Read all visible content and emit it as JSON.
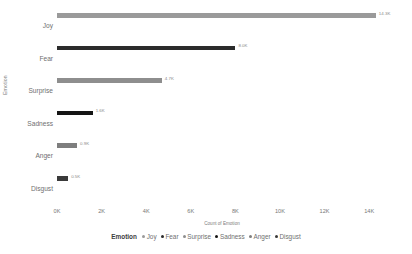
{
  "chart_data": {
    "type": "bar",
    "orientation": "horizontal",
    "title": "",
    "xlabel": "Count of Emotion",
    "ylabel": "Emotion",
    "categories": [
      "Joy",
      "Fear",
      "Surprise",
      "Sadness",
      "Anger",
      "Disgust"
    ],
    "values": [
      14300,
      8000,
      4700,
      1600,
      900,
      500
    ],
    "data_labels": [
      "14.3K",
      "8.0K",
      "4.7K",
      "1.6K",
      "0.9K",
      "0.5K"
    ],
    "colors": [
      "#9a9a9a",
      "#2b2b2b",
      "#8e8e8e",
      "#151515",
      "#7e7e7e",
      "#3a3a3a"
    ],
    "xlim": [
      0,
      14800
    ],
    "xticks": [
      0,
      2000,
      4000,
      6000,
      8000,
      10000,
      12000,
      14000
    ],
    "xticklabels": [
      "0K",
      "2K",
      "4K",
      "6K",
      "8K",
      "10K",
      "12K",
      "14K"
    ],
    "grid": false,
    "legend_position": "bottom",
    "legend_title": "Emotion",
    "legend_entries": [
      {
        "label": "Joy",
        "color": "#9a9a9a"
      },
      {
        "label": "Fear",
        "color": "#2b2b2b"
      },
      {
        "label": "Surprise",
        "color": "#8e8e8e"
      },
      {
        "label": "Sadness",
        "color": "#151515"
      },
      {
        "label": "Anger",
        "color": "#7e7e7e"
      },
      {
        "label": "Disgust",
        "color": "#3a3a3a"
      }
    ]
  }
}
